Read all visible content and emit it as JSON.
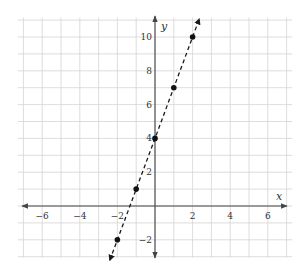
{
  "chart_data": {
    "type": "line",
    "title": "",
    "xlabel": "x",
    "ylabel": "y",
    "xlim": [
      -7,
      7
    ],
    "ylim": [
      -3,
      11
    ],
    "grid": true,
    "x_ticks": [
      -6,
      -4,
      -2,
      2,
      4,
      6
    ],
    "y_ticks": [
      -2,
      2,
      4,
      6,
      8,
      10
    ],
    "x_tick_labels": [
      "−6",
      "−4",
      "−2",
      "2",
      "4",
      "6"
    ],
    "y_tick_labels": [
      "−2",
      "2",
      "4",
      "6",
      "8",
      "10"
    ],
    "series": [
      {
        "name": "y = 3x + 4",
        "style": "dashed",
        "arrows_both_ends": true,
        "points": [
          {
            "x": -2,
            "y": -2
          },
          {
            "x": -1,
            "y": 1
          },
          {
            "x": 0,
            "y": 4
          },
          {
            "x": 1,
            "y": 7
          },
          {
            "x": 2,
            "y": 10
          }
        ]
      }
    ]
  },
  "colors": {
    "grid": "#d4d4d4",
    "axis": "#444444",
    "line": "#1a1a1a",
    "point": "#111111"
  }
}
